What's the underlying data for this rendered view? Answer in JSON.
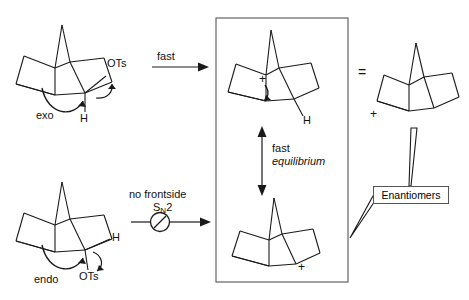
{
  "diagram": {
    "type": "reaction-scheme"
  },
  "left_column": {
    "top_structure": {
      "name": "exo-2-norbornyl tosylate",
      "stereo_label": "exo",
      "leaving_group": "OTs",
      "hydrogen_label": "H"
    },
    "bottom_structure": {
      "name": "endo-2-norbornyl tosylate",
      "stereo_label": "endo",
      "leaving_group": "OTs",
      "hydrogen_label": "H"
    }
  },
  "arrows": {
    "top": {
      "label": "fast"
    },
    "bottom": {
      "label_line1": "no frontside",
      "label_line2_main": "S",
      "label_line2_sub": "N",
      "label_line2_tail": "2",
      "blocked": true,
      "blocked_icon": "no-entry-icon"
    },
    "equilibrium": {
      "label_line1": "fast",
      "label_line2": "equilibrium",
      "direction": "double-headed-vertical"
    }
  },
  "center_box": {
    "top_cation": {
      "name": "nonclassical norbornyl cation",
      "charge": "+",
      "hydrogen_label": "H"
    },
    "bottom_cation": {
      "name": "nonclassical norbornyl cation (mirror)",
      "charge": "+"
    }
  },
  "right_column": {
    "equals_sign": "=",
    "structure": {
      "name": "norbornyl cation redrawn",
      "charge": "+"
    },
    "enantiomers_label": "Enantiomers"
  },
  "colors": {
    "stroke": "#1a1a1a",
    "box_border": "#555555",
    "background": "#ffffff"
  }
}
